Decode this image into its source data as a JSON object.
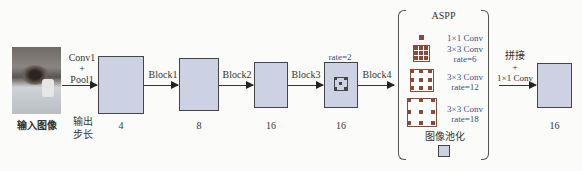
{
  "diagram": {
    "input": {
      "label": "输入图像",
      "icon": "cat-photo"
    },
    "stride_label": "输出\n步长",
    "stride_label_lines": [
      "输出",
      "步长"
    ],
    "stages": [
      {
        "arrow_label_lines": [
          "Conv1",
          "+",
          "Pool1"
        ],
        "stride": "4"
      },
      {
        "arrow_label": "Block1",
        "stride": "8"
      },
      {
        "arrow_label": "Block2",
        "stride": "16"
      },
      {
        "arrow_label": "Block3",
        "stride": "16",
        "annotation": "rate=2"
      }
    ],
    "block4_label": "Block4",
    "aspp": {
      "title": "ASPP",
      "branches": [
        {
          "line1": "1×1 Conv",
          "line2": ""
        },
        {
          "line1": "3×3 Conv",
          "line2": "rate=6"
        },
        {
          "line1": "3×3 Conv",
          "line2": "rate=12"
        },
        {
          "line1": "3×3 Conv",
          "line2": "rate=18"
        }
      ],
      "pooling_label": "图像池化"
    },
    "fusion": {
      "lines": [
        "拼接",
        "+",
        "1×1 Conv"
      ]
    },
    "output": {
      "stride": "16"
    },
    "colors": {
      "box_fill": "#ccd2e3",
      "box_border": "#444444",
      "kernel": "#8a4a35",
      "rate_text": "#3a4f8a"
    }
  }
}
